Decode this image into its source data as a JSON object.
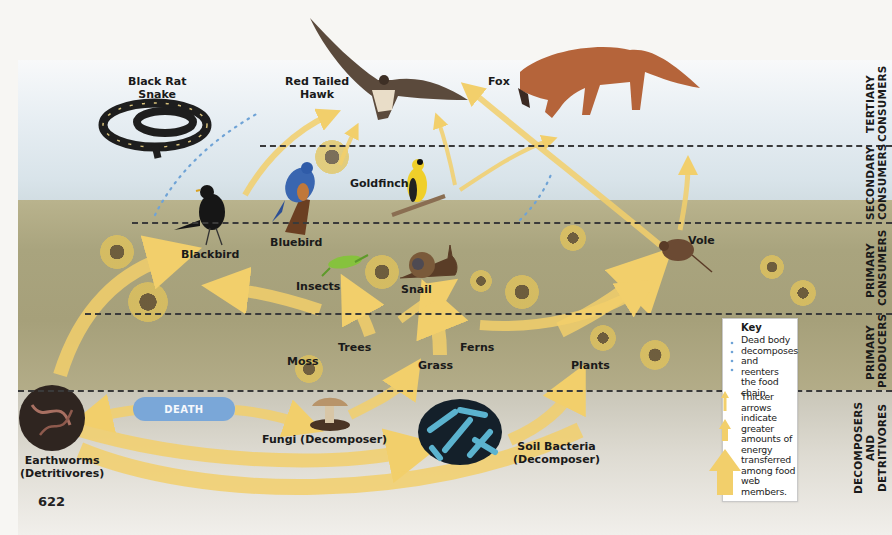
{
  "figure": {
    "page_number": "622",
    "trophic_levels": [
      {
        "id": "tertiary",
        "line1": "TERTIARY",
        "line2": "CONSUMERS"
      },
      {
        "id": "secondary",
        "line1": "SECONDARY",
        "line2": "CONSUMERS"
      },
      {
        "id": "primary_consumers",
        "line1": "PRIMARY",
        "line2": "CONSUMERS"
      },
      {
        "id": "primary_producers",
        "line1": "PRIMARY",
        "line2": "PRODUCERS"
      },
      {
        "id": "decomposers",
        "line1": "DECOMPOSERS",
        "line2": "AND DETRITIVORES"
      }
    ],
    "organisms": {
      "black_rat_snake": {
        "line1": "Black Rat",
        "line2": "Snake"
      },
      "red_tailed_hawk": {
        "line1": "Red Tailed",
        "line2": "Hawk"
      },
      "fox": "Fox",
      "goldfinch": "Goldfinch",
      "bluebird": "Bluebird",
      "blackbird": "Blackbird",
      "insects": "Insects",
      "snail": "Snail",
      "vole": "Vole",
      "moss": "Moss",
      "trees": "Trees",
      "grass": "Grass",
      "ferns": "Ferns",
      "plants": "Plants",
      "fungi": "Fungi (Decomposer)",
      "soil_bacteria": {
        "line1": "Soil Bacteria",
        "line2": "(Decomposer)"
      },
      "earthworms": {
        "line1": "Earthworms",
        "line2": "(Detritivores)"
      }
    },
    "death_label": "DEATH",
    "key": {
      "title": "Key",
      "dotted_text": [
        "Dead body",
        "decomposes",
        "and reenters",
        "the food",
        "chain."
      ],
      "arrow_text": [
        "Thicker arrows",
        "indicate",
        "greater",
        "amounts of",
        "energy",
        "transferred",
        "among food",
        "web members."
      ]
    },
    "colors": {
      "arrow": "#f2cf6b",
      "dotted_line": "#6fa3d6",
      "death_pill": "#7aa7d8",
      "dash_line": "#3a3a3a"
    }
  }
}
